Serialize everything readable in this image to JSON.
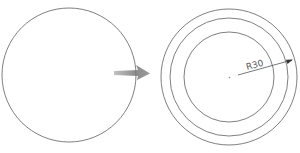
{
  "diagram": {
    "type": "offset-circle-operation",
    "before": {
      "shape": "circle",
      "cx": 69,
      "cy": 75,
      "r": 67
    },
    "transition_arrow": {
      "direction": "right",
      "color": "#7a7a7a"
    },
    "after": {
      "shape": "concentric-circles",
      "cx": 229,
      "cy": 77,
      "radii": [
        68,
        59,
        45
      ]
    },
    "dimension": {
      "label": "R30",
      "type": "radius"
    },
    "colors": {
      "stroke": "#6e6e6e",
      "background": "#ffffff"
    }
  }
}
